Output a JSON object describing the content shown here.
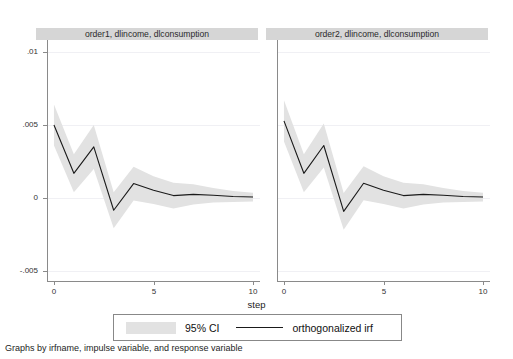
{
  "figure": {
    "cut_off_top_title": "",
    "axis_title_x": "step",
    "caption": "Graphs by irfname, impulse variable, and response variable",
    "background_color": "#ffffff",
    "panel_header_color": "#d6d6d6",
    "ci_band_color": "#e2e2e2",
    "line_color": "#1a1a1a",
    "axis_color": "#8a8a8a"
  },
  "legend": {
    "ci_label": "95% CI",
    "irf_label": "orthogonalized irf"
  },
  "panels": [
    {
      "title": "order1, dlincome, dlconsumption"
    },
    {
      "title": "order2, dlincome, dlconsumption"
    }
  ],
  "axes": {
    "y_ticks": [
      {
        "label": ".01",
        "value": 0.01
      },
      {
        "label": ".005",
        "value": 0.005
      },
      {
        "label": "0",
        "value": 0
      },
      {
        "label": "-.005",
        "value": -0.005
      }
    ],
    "x_ticks": [
      {
        "label": "0",
        "value": 0
      },
      {
        "label": "5",
        "value": 5
      },
      {
        "label": "10",
        "value": 10
      }
    ],
    "ylim": [
      -0.00565,
      0.0108
    ],
    "xlim": [
      -0.35,
      10.35
    ]
  },
  "chart_data": {
    "type": "line",
    "title": "",
    "xlabel": "step",
    "ylabel": "",
    "ylim": [
      -0.00565,
      0.0108
    ],
    "xlim": [
      -0.35,
      10.35
    ],
    "grid": true,
    "legend_position": "bottom",
    "panels": [
      {
        "name": "order1, dlincome, dlconsumption",
        "x": [
          0,
          1,
          2,
          3,
          4,
          5,
          6,
          7,
          8,
          9,
          10
        ],
        "series": [
          {
            "name": "orthogonalized irf",
            "values": [
              0.005,
              0.0017,
              0.0035,
              -0.00082,
              0.001,
              0.00055,
              0.00018,
              0.00026,
              0.0002,
              0.00012,
              8e-05
            ]
          },
          {
            "name": "95% CI upper",
            "values": [
              0.0064,
              0.003,
              0.005,
              0.0004,
              0.00215,
              0.0015,
              0.00105,
              0.00095,
              0.0007,
              0.0005,
              0.00038
            ]
          },
          {
            "name": "95% CI lower",
            "values": [
              0.0036,
              0.0004,
              0.002,
              -0.00205,
              -0.00015,
              -0.0004,
              -0.0007,
              -0.00043,
              -0.0003,
              -0.00026,
              -0.00022
            ]
          }
        ]
      },
      {
        "name": "order2, dlincome, dlconsumption",
        "x": [
          0,
          1,
          2,
          3,
          4,
          5,
          6,
          7,
          8,
          9,
          10
        ],
        "series": [
          {
            "name": "orthogonalized irf",
            "values": [
              0.00528,
              0.0017,
              0.0036,
              -0.0009,
              0.00102,
              0.00055,
              0.00018,
              0.00026,
              0.0002,
              0.00012,
              8e-05
            ]
          },
          {
            "name": "95% CI upper",
            "values": [
              0.00668,
              0.003,
              0.0051,
              0.00035,
              0.00218,
              0.0015,
              0.00105,
              0.00095,
              0.0007,
              0.0005,
              0.00038
            ]
          },
          {
            "name": "95% CI lower",
            "values": [
              0.00388,
              0.0004,
              0.0021,
              -0.00215,
              -0.00014,
              -0.0004,
              -0.0007,
              -0.00043,
              -0.0003,
              -0.00026,
              -0.00022
            ]
          }
        ]
      }
    ]
  }
}
